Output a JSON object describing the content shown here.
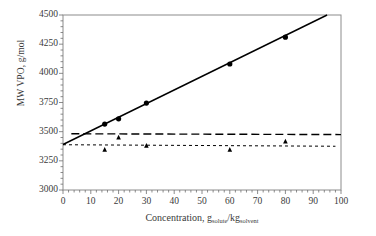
{
  "chart_data": {
    "type": "scatter",
    "title": "",
    "xlabel": "Concentration, g_solute/kg_solvent",
    "xlabel_parts": {
      "main": "Concentration, g",
      "sub1": "solute",
      "mid": "/kg",
      "sub2": "solvent"
    },
    "ylabel": "MW VPO, g/mol",
    "xlim": [
      0,
      100
    ],
    "ylim": [
      3000,
      4500
    ],
    "xticks": [
      0,
      10,
      20,
      30,
      40,
      50,
      60,
      70,
      80,
      90,
      100
    ],
    "yticks": [
      3000,
      3250,
      3500,
      3750,
      4000,
      4250,
      4500
    ],
    "xtick_labels": [
      "0",
      "10",
      "20",
      "30",
      "40",
      "50",
      "60",
      "70",
      "80",
      "90",
      "100"
    ],
    "ytick_labels": [
      "3000",
      "3250",
      "3500",
      "3750",
      "4000",
      "4250",
      "4500"
    ],
    "minor_ticks": true,
    "grid": false,
    "legend": "none",
    "series": [
      {
        "name": "circle-series",
        "marker": "circle",
        "color": "#000000",
        "x": [
          15,
          20,
          30,
          60,
          80
        ],
        "values": [
          3565,
          3610,
          3745,
          4080,
          4310
        ]
      },
      {
        "name": "triangle-series",
        "marker": "triangle",
        "color": "#000000",
        "x": [
          15,
          20,
          30,
          60,
          80
        ],
        "values": [
          3345,
          3450,
          3380,
          3345,
          3415
        ]
      }
    ],
    "lines": [
      {
        "name": "solid-fit-line",
        "style": "solid",
        "color": "#000000",
        "x": [
          0,
          95
        ],
        "values": [
          3390,
          4500
        ]
      },
      {
        "name": "long-dashed-line",
        "style": "long-dash",
        "color": "#000000",
        "x": [
          3,
          100
        ],
        "values": [
          3482,
          3475
        ]
      },
      {
        "name": "short-dashed-line",
        "style": "short-dash",
        "color": "#000000",
        "x": [
          0,
          98
        ],
        "values": [
          3388,
          3375
        ]
      }
    ]
  },
  "axes": {
    "frame_color": "#8c8c8c",
    "tick_color": "#6e6e6e",
    "text_color": "#3a3a3a"
  }
}
